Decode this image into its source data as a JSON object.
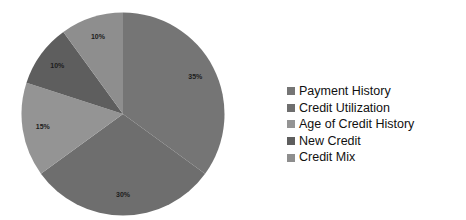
{
  "chart_data": {
    "type": "pie",
    "title": "",
    "subtitle": "",
    "xlabel": "",
    "ylabel": "",
    "grid": false,
    "legend_position": "right",
    "start_angle_deg": 0,
    "direction": "clockwise",
    "categories": [
      "Payment History",
      "Credit Utilization",
      "Age of Credit History",
      "New Credit",
      "Credit Mix"
    ],
    "values": [
      35,
      30,
      15,
      10,
      10
    ],
    "data_labels": [
      "35%",
      "30%",
      "15%",
      "10%",
      "10%"
    ],
    "colors": [
      "#757575",
      "#6e6e6e",
      "#949494",
      "#5e5e5e",
      "#8e8e8e"
    ],
    "background_color": "#ffffff",
    "label_color": "#1c1c1c",
    "slices": [
      {
        "label": "Payment History",
        "value": 35,
        "data_label": "35%",
        "color": "#757575"
      },
      {
        "label": "Credit Utilization",
        "value": 30,
        "data_label": "30%",
        "color": "#6e6e6e"
      },
      {
        "label": "Age of Credit History",
        "value": 15,
        "data_label": "15%",
        "color": "#949494"
      },
      {
        "label": "New Credit",
        "value": 10,
        "data_label": "10%",
        "color": "#5e5e5e"
      },
      {
        "label": "Credit Mix",
        "value": 10,
        "data_label": "10%",
        "color": "#8e8e8e"
      }
    ]
  },
  "legend": {
    "items": [
      {
        "label": "Payment History",
        "color": "#757575"
      },
      {
        "label": "Credit Utilization",
        "color": "#6e6e6e"
      },
      {
        "label": "Age of Credit History",
        "color": "#949494"
      },
      {
        "label": "New Credit",
        "color": "#5e5e5e"
      },
      {
        "label": "Credit Mix",
        "color": "#8e8e8e"
      }
    ]
  }
}
